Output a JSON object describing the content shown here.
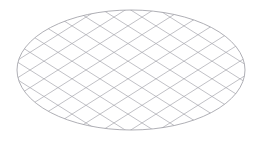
{
  "figure": {
    "background_color": "#ffffff",
    "canvas": {
      "width": 259,
      "height": 141
    }
  },
  "shape": {
    "type": "ellipse",
    "center_x": 131,
    "center_y": 70,
    "radius_x": 114,
    "radius_y": 60,
    "rotation_deg": 0,
    "stroke_color": "#9a9aa2",
    "stroke_width": 0.8,
    "fill": "none",
    "bounds": {
      "left": 17,
      "top": 10,
      "right": 245,
      "bottom": 130
    }
  },
  "hatch": {
    "stroke_color": "#a6a6ae",
    "stroke_width": 0.7,
    "families": [
      {
        "name": "descending",
        "direction": "down-right",
        "slope": 0.63,
        "angle_deg": 32,
        "count": 17,
        "spacing_px": 28,
        "x_intercepts": [
          -110,
          -82,
          -54,
          -26,
          2,
          30,
          58,
          86,
          114,
          142,
          170,
          198,
          226,
          254,
          282,
          310,
          338
        ]
      },
      {
        "name": "ascending",
        "direction": "up-right",
        "slope": -0.63,
        "angle_deg": -32,
        "count": 17,
        "spacing_px": 28,
        "x_intercepts": [
          -110,
          -82,
          -54,
          -26,
          2,
          30,
          58,
          86,
          114,
          142,
          170,
          198,
          226,
          254,
          282,
          310,
          338
        ]
      }
    ]
  }
}
